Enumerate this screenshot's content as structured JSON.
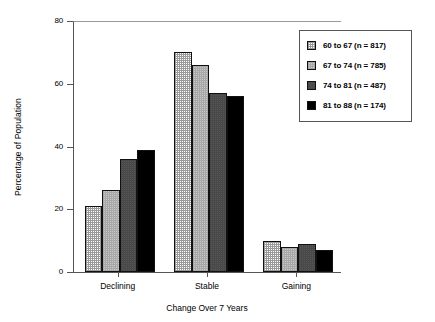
{
  "chart_data": {
    "type": "bar",
    "title": "",
    "xlabel": "Change Over 7 Years",
    "ylabel": "Percentage of Population",
    "categories": [
      "Declining",
      "Stable",
      "Gaining"
    ],
    "ylim": [
      0,
      80
    ],
    "yticks": [
      0,
      20,
      40,
      60,
      80
    ],
    "ytick_labels": [
      "0",
      "20",
      "40",
      "60",
      "80"
    ],
    "grid": false,
    "legend_position": "upper right",
    "series": [
      {
        "name": "60 to 67 (n = 817)",
        "age_range": "60 to 67",
        "n": 817,
        "fill": "fill-1",
        "color": "#ffffff",
        "values": [
          21,
          70,
          10
        ]
      },
      {
        "name": "67 to 74 (n = 785)",
        "age_range": "67 to 74",
        "n": 785,
        "fill": "fill-2",
        "color": "#c9c9c9",
        "values": [
          26,
          66,
          8
        ]
      },
      {
        "name": "74 to 81 (n = 487)",
        "age_range": "74 to 81",
        "n": 487,
        "fill": "fill-3",
        "color": "#565656",
        "values": [
          36,
          57,
          9
        ]
      },
      {
        "name": "81 to 88 (n = 174)",
        "age_range": "81 to 88",
        "n": 174,
        "fill": "fill-4",
        "color": "#000000",
        "values": [
          39,
          56,
          7
        ]
      }
    ]
  }
}
